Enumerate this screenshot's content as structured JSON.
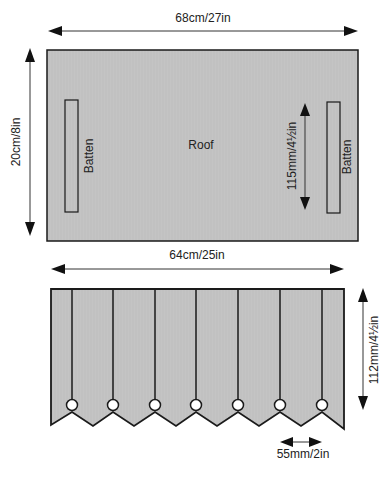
{
  "diagram": {
    "roof": {
      "label": "Roof",
      "width_label": "68cm/27in",
      "height_label": "20cm/8in",
      "fill": "#c4c4c4",
      "battens": [
        {
          "label": "Batten",
          "side": "left"
        },
        {
          "label": "Batten",
          "side": "right"
        }
      ],
      "batten_spacing_label": "115mm/4½in"
    },
    "valance": {
      "width_label": "64cm/25in",
      "height_label": "112mm/4½in",
      "point_spacing_label": "55mm/2in",
      "fill": "#c4c4c4",
      "pleat_count": 7
    },
    "colors": {
      "stroke": "#1a1a1a",
      "fill": "#c4c4c4",
      "background": "#ffffff"
    }
  }
}
